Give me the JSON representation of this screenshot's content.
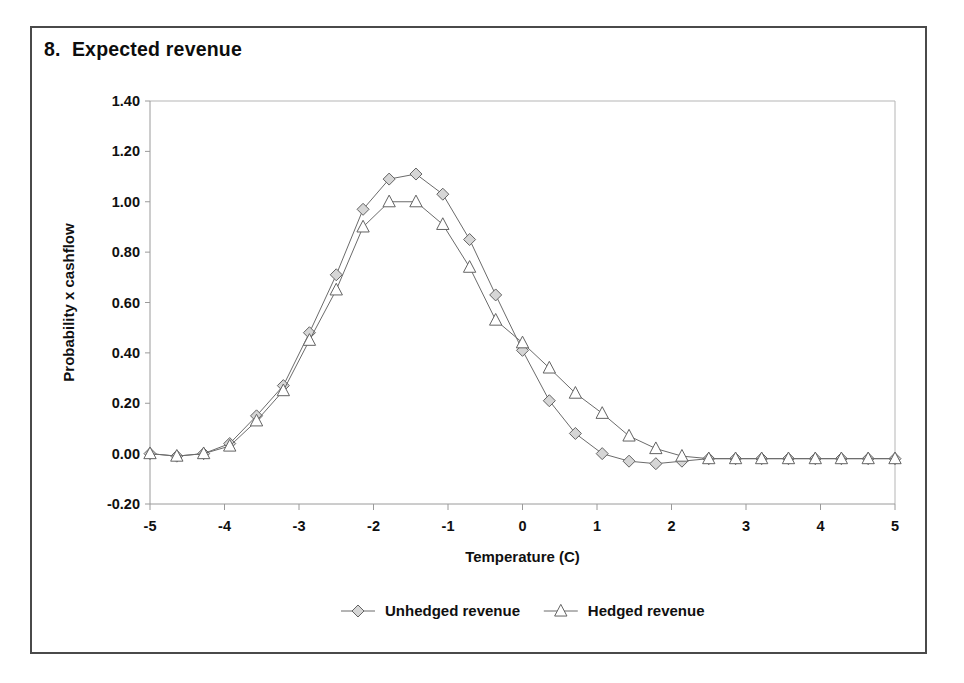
{
  "figure": {
    "title": "8.  Expected revenue"
  },
  "chart_data": {
    "type": "line",
    "title": "8.  Expected revenue",
    "xlabel": "Temperature (C)",
    "ylabel": "Probability x cashflow",
    "xlim": [
      -5,
      5
    ],
    "ylim": [
      -0.2,
      1.4
    ],
    "xticks": [
      -5,
      -4,
      -3,
      -2,
      -1,
      0,
      1,
      2,
      3,
      4,
      5
    ],
    "xticklabels": [
      "-5",
      "-4",
      "-3",
      "-2",
      "-1",
      "0",
      "1",
      "2",
      "3",
      "4",
      "5"
    ],
    "yticks": [
      -0.2,
      0,
      0.2,
      0.4,
      0.6,
      0.8,
      1,
      1.2,
      1.4
    ],
    "yticklabels": [
      "-0.20",
      "0.00",
      "0.20",
      "0.40",
      "0.60",
      "0.80",
      "1.00",
      "1.20",
      "1.40"
    ],
    "grid": false,
    "legend_position": "bottom",
    "x": [
      -5.0,
      -4.64,
      -4.28,
      -3.93,
      -3.57,
      -3.21,
      -2.86,
      -2.5,
      -2.14,
      -1.79,
      -1.43,
      -1.07,
      -0.71,
      -0.36,
      0.0,
      0.36,
      0.71,
      1.07,
      1.43,
      1.79,
      2.14,
      2.5,
      2.86,
      3.21,
      3.57,
      3.93,
      4.28,
      4.64,
      5.0
    ],
    "series": [
      {
        "name": "Unhedged revenue",
        "marker": "diamond",
        "values": [
          0.0,
          -0.01,
          0.0,
          0.04,
          0.15,
          0.27,
          0.48,
          0.71,
          0.97,
          1.09,
          1.11,
          1.03,
          0.85,
          0.63,
          0.41,
          0.21,
          0.08,
          0.0,
          -0.03,
          -0.04,
          -0.03,
          -0.02,
          -0.02,
          -0.02,
          -0.02,
          -0.02,
          -0.02,
          -0.02,
          -0.02
        ]
      },
      {
        "name": "Hedged revenue",
        "marker": "triangle",
        "values": [
          0.0,
          -0.01,
          0.0,
          0.03,
          0.13,
          0.25,
          0.45,
          0.65,
          0.9,
          1.0,
          1.0,
          0.91,
          0.74,
          0.53,
          0.44,
          0.34,
          0.24,
          0.16,
          0.07,
          0.02,
          -0.01,
          -0.02,
          -0.02,
          -0.02,
          -0.02,
          -0.02,
          -0.02,
          -0.02,
          -0.02
        ]
      }
    ]
  },
  "legend": {
    "items": [
      {
        "label": "Unhedged revenue",
        "marker": "diamond-marker-icon"
      },
      {
        "label": "Hedged revenue",
        "marker": "triangle-marker-icon"
      }
    ]
  }
}
